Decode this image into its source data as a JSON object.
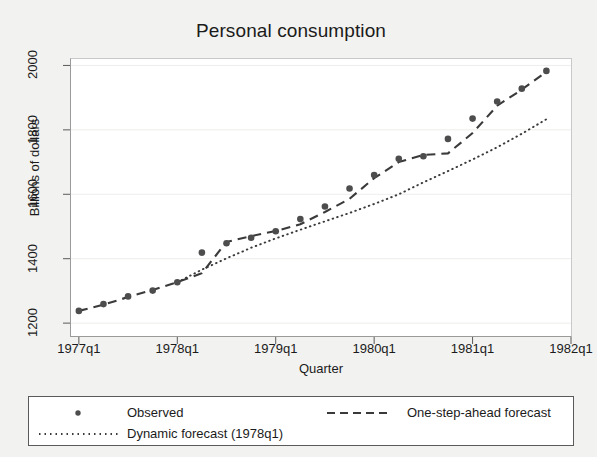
{
  "chart_data": {
    "type": "line",
    "title": "Personal consumption",
    "xlabel": "Quarter",
    "ylabel": "Billions of dollars",
    "grid": true,
    "legend_position": "bottom",
    "x": [
      "1977q1",
      "1977q2",
      "1977q3",
      "1977q4",
      "1978q1",
      "1978q2",
      "1978q3",
      "1978q4",
      "1979q1",
      "1979q2",
      "1979q3",
      "1979q4",
      "1980q1",
      "1980q2",
      "1980q3",
      "1980q4",
      "1981q1",
      "1981q2",
      "1981q3",
      "1981q4"
    ],
    "xtick_labels": [
      "1977q1",
      "1978q1",
      "1979q1",
      "1980q1",
      "1981q1",
      "1982q1"
    ],
    "xtick_values": [
      1977.0,
      1978.0,
      1979.0,
      1980.0,
      1981.0,
      1982.0
    ],
    "xlim": [
      1976.92,
      1982.0
    ],
    "ytick_labels": [
      "1200",
      "1400",
      "1600",
      "1800",
      "2000"
    ],
    "ytick_values": [
      1200,
      1400,
      1600,
      1800,
      2000
    ],
    "ylim": [
      1160,
      2020
    ],
    "series": [
      {
        "name": "Observed",
        "style": "markers",
        "marker": "circle",
        "color": "#4d4d4d",
        "values": [
          1238,
          1259,
          1283,
          1301,
          1327,
          1419,
          1448,
          1465,
          1485,
          1523,
          1562,
          1618,
          1660,
          1710,
          1718,
          1772,
          1835,
          1888,
          1928,
          1983
        ]
      },
      {
        "name": "One-step-ahead forecast",
        "style": "dashed",
        "color": "#3a3a3a",
        "values": [
          1238,
          1257,
          1281,
          1303,
          1327,
          1355,
          1452,
          1470,
          1486,
          1507,
          1545,
          1586,
          1650,
          1700,
          1722,
          1727,
          1790,
          1875,
          1925,
          1980
        ]
      },
      {
        "name": "Dynamic forecast (1978q1)",
        "style": "dotted",
        "color": "#3a3a3a",
        "values": [
          null,
          null,
          null,
          null,
          1327,
          1366,
          1401,
          1434,
          1463,
          1490,
          1516,
          1542,
          1570,
          1600,
          1637,
          1672,
          1708,
          1746,
          1788,
          1833
        ]
      }
    ]
  },
  "legend": {
    "items": [
      {
        "label": "Observed",
        "key": "marker-dot"
      },
      {
        "label": "One-step-ahead forecast",
        "key": "dashed-line"
      },
      {
        "label": "Dynamic forecast (1978q1)",
        "key": "dotted-line"
      }
    ]
  }
}
